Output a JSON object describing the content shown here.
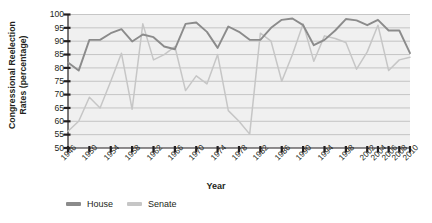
{
  "chart_data": {
    "type": "line",
    "title": "",
    "xlabel": "Year",
    "ylabel": "Congressional Reelection Rates (percentage)",
    "ylabel_line1": "Congressional Reelection",
    "ylabel_line2": "Rates (percentage)",
    "ylim": [
      50,
      100
    ],
    "yticks": [
      50,
      55,
      60,
      65,
      70,
      75,
      80,
      85,
      90,
      95,
      100
    ],
    "xlim": [
      1946,
      2010
    ],
    "xticks": [
      1946,
      1950,
      1954,
      1958,
      1962,
      1966,
      1970,
      1974,
      1978,
      1982,
      1986,
      1990,
      1994,
      1998,
      2002,
      2004,
      2006,
      2008,
      2010
    ],
    "grid": true,
    "legend_position": "bottom-left",
    "x": [
      1946,
      1948,
      1950,
      1952,
      1954,
      1956,
      1958,
      1960,
      1962,
      1964,
      1966,
      1968,
      1970,
      1972,
      1974,
      1976,
      1978,
      1980,
      1982,
      1984,
      1986,
      1988,
      1990,
      1992,
      1994,
      1996,
      1998,
      2000,
      2002,
      2004,
      2006,
      2008,
      2010
    ],
    "series": [
      {
        "name": "House",
        "color": "#8b8b8b",
        "values": [
          82,
          79,
          90.5,
          90.5,
          93,
          94.5,
          89.9,
          92.5,
          91.5,
          88,
          87,
          96.5,
          97,
          93.5,
          87.5,
          95.5,
          93.5,
          90.5,
          90.5,
          95,
          98,
          98.5,
          96,
          88.5,
          90.5,
          94,
          98.3,
          97.8,
          96,
          98,
          94,
          94,
          85.5
        ]
      },
      {
        "name": "Senate",
        "color": "#c6c6c6",
        "values": [
          56.3,
          60,
          69,
          65,
          75,
          85.5,
          64.5,
          96.5,
          83,
          85,
          88,
          71.5,
          77,
          74,
          85,
          64,
          60,
          55.2,
          93,
          90,
          75,
          85,
          96.5,
          82.5,
          92,
          91,
          89.5,
          79.5,
          86,
          96,
          79,
          83,
          84
        ]
      }
    ],
    "legend": [
      {
        "label": "House",
        "color": "#8b8b8b"
      },
      {
        "label": "Senate",
        "color": "#c6c6c6"
      }
    ],
    "plot_bg": "#f0f0f0",
    "grid_color": "#b9b9b9",
    "axis_color": "#231f20"
  }
}
